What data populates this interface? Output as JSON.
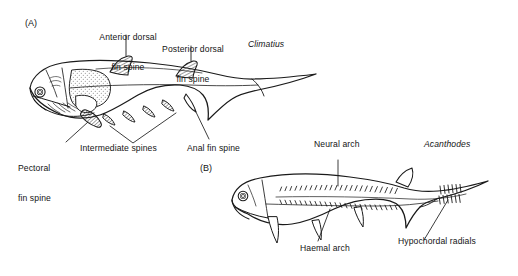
{
  "figure": {
    "background_color": "#ffffff",
    "ink_color": "#141414",
    "panels": [
      {
        "id": "A",
        "label": "(A)",
        "taxon": "Climatius"
      },
      {
        "id": "B",
        "label": "(B)",
        "taxon": "Acanthodes"
      }
    ]
  },
  "panel_a": {
    "label": "(A)",
    "taxon": "Climatius",
    "annotations": [
      {
        "name": "anterior-dorsal-fin-spine",
        "line1": "Anterior dorsal",
        "line2": "fin spine"
      },
      {
        "name": "posterior-dorsal-fin-spine",
        "line1": "Posterior dorsal",
        "line2": "fin spine"
      },
      {
        "name": "pectoral-fin-spine",
        "line1": "Pectoral",
        "line2": "fin spine"
      },
      {
        "name": "intermediate-spines",
        "line1": "Intermediate spines",
        "line2": ""
      },
      {
        "name": "anal-fin-spine",
        "line1": "Anal fin spine",
        "line2": ""
      }
    ]
  },
  "panel_b": {
    "label": "(B)",
    "taxon": "Acanthodes",
    "annotations": [
      {
        "name": "neural-arch",
        "line1": "Neural arch",
        "line2": ""
      },
      {
        "name": "haemal-arch",
        "line1": "Haemal arch",
        "line2": ""
      },
      {
        "name": "hypochordal-radials",
        "line1": "Hypochordal radials",
        "line2": ""
      }
    ]
  }
}
